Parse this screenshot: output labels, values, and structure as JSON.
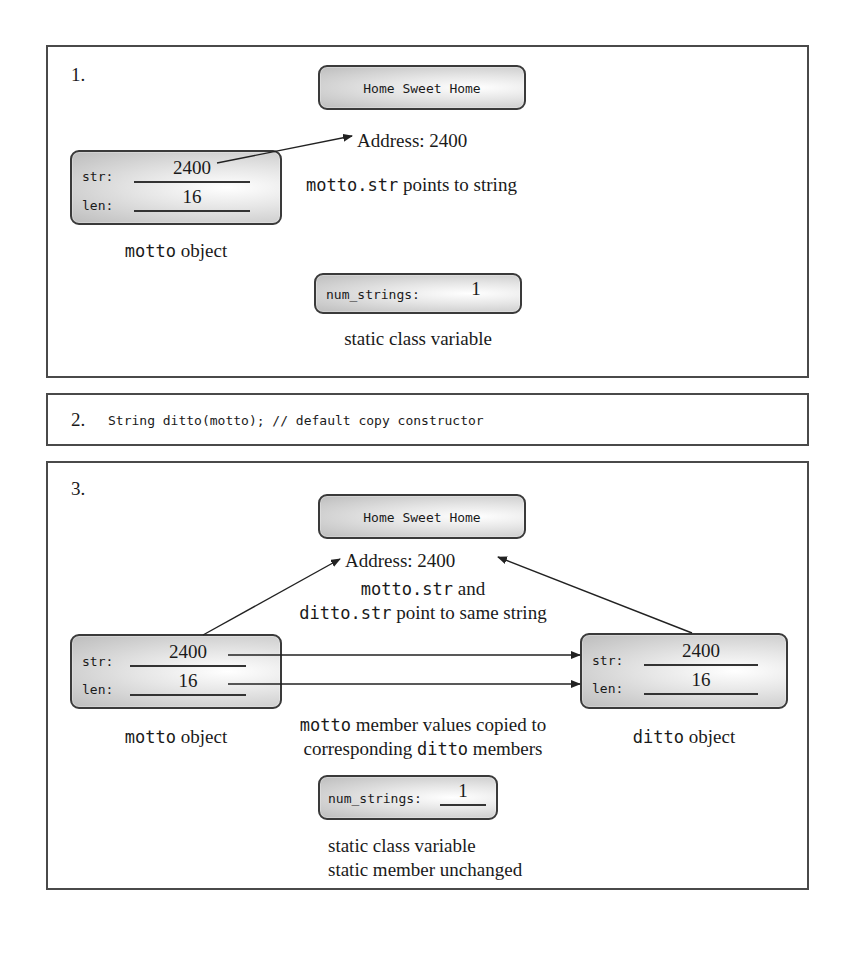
{
  "panel1": {
    "step": "1.",
    "string_box": "Home Sweet Home",
    "address_label": "Address: 2400",
    "motto": {
      "str_label": "str:",
      "str_value": "2400",
      "len_label": "len:",
      "len_value": "16",
      "caption_code": "motto",
      "caption_text": " object"
    },
    "pointer_caption": {
      "code": "motto.str",
      "text": " points to string"
    },
    "static_box": {
      "label": "num_strings:",
      "value": "1"
    },
    "static_caption": "static class variable"
  },
  "panel2": {
    "step": "2.",
    "code": "String ditto(motto); // default copy constructor"
  },
  "panel3": {
    "step": "3.",
    "string_box": "Home Sweet Home",
    "address_label": "Address: 2400",
    "shared_caption": {
      "line1_code": "motto.str",
      "line1_text": " and",
      "line2_code": "ditto.str",
      "line2_text": " point to same string"
    },
    "motto": {
      "str_label": "str:",
      "str_value": "2400",
      "len_label": "len:",
      "len_value": "16",
      "caption_code": "motto",
      "caption_text": " object"
    },
    "ditto": {
      "str_label": "str:",
      "str_value": "2400",
      "len_label": "len:",
      "len_value": "16",
      "caption_code": "ditto",
      "caption_text": " object"
    },
    "copy_caption": {
      "line1_code": "motto",
      "line1_text": " member values copied to",
      "line2_text_pre": "corresponding ",
      "line2_code": "ditto",
      "line2_text_post": " members"
    },
    "static_box": {
      "label": "num_strings:",
      "value": "1"
    },
    "static_caption_1": "static class variable",
    "static_caption_2": "static member unchanged"
  }
}
